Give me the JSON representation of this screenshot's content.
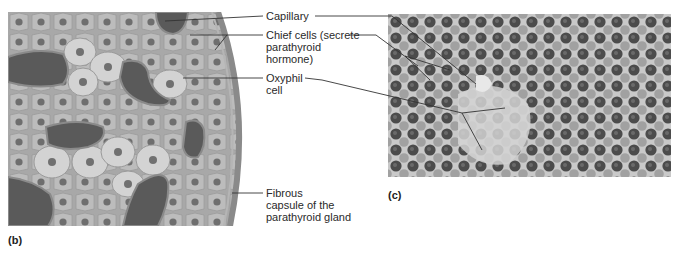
{
  "figure": {
    "panels": [
      {
        "id": "b",
        "letter": "(b)",
        "description": "Illustration of parathyroid gland tissue"
      },
      {
        "id": "c",
        "letter": "(c)",
        "description": "Light micrograph of parathyroid gland tissue"
      }
    ],
    "labels": {
      "capillary": "Capillary",
      "chief_cells_line1": "Chief cells (secrete",
      "chief_cells_line2": "parathyroid",
      "chief_cells_line3": "hormone)",
      "oxyphil_line1": "Oxyphil",
      "oxyphil_line2": "cell",
      "capsule_line1": "Fibrous",
      "capsule_line2": "capsule of the",
      "capsule_line3": "parathyroid gland"
    },
    "colors": {
      "tissue_bg": "#a9a9a9",
      "cell_fill": "#bdbdbd",
      "large_cell_fill": "#d2d2d2",
      "nucleus": "#6e6e6e",
      "capillary": "#5a5a5a",
      "micro_bg": "#c8c8c8",
      "micro_nucleus": "#4a4a4a",
      "leader_line": "#333333"
    }
  }
}
